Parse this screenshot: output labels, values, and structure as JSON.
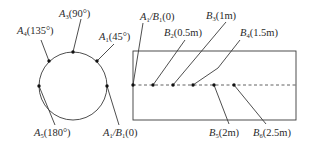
{
  "colors": {
    "line": "#3a3a3a",
    "dot": "#111111",
    "text": "#2a2a2a",
    "background": "#ffffff"
  },
  "circle_diagram": {
    "points": [
      {
        "name": "A",
        "sub": "1",
        "post": "",
        "name2": "",
        "sub2": "",
        "value": "(45°)"
      },
      {
        "name": "A",
        "sub": "3",
        "post": "",
        "name2": "",
        "sub2": "",
        "value": "(90°)"
      },
      {
        "name": "A",
        "sub": "4",
        "post": "",
        "name2": "",
        "sub2": "",
        "value": "(135°)"
      },
      {
        "name": "A",
        "sub": "5",
        "post": "",
        "name2": "",
        "sub2": "",
        "value": "(180°)"
      },
      {
        "name": "A",
        "sub": "1",
        "post": "/",
        "name2": "B",
        "sub2": "1",
        "value": "(0)"
      }
    ]
  },
  "rect_diagram": {
    "points": [
      {
        "name": "A",
        "sub": "1",
        "post": "/",
        "name2": "B",
        "sub2": "1",
        "value": "(0)"
      },
      {
        "name": "B",
        "sub": "2",
        "value": "(0.5m)"
      },
      {
        "name": "B",
        "sub": "3",
        "value": "(1m)"
      },
      {
        "name": "B",
        "sub": "4",
        "value": "(1.5m)"
      },
      {
        "name": "B",
        "sub": "5",
        "value": "(2m)"
      },
      {
        "name": "B",
        "sub": "6",
        "value": "(2.5m)"
      }
    ]
  }
}
